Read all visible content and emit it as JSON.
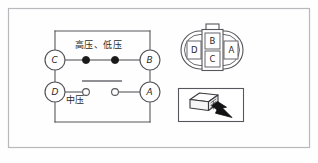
{
  "figure": {
    "name": "pressure-switch-connector-wiring-figure",
    "outer_frame": {
      "stroke": "#b9b9bd",
      "fill": "#fefefe"
    },
    "line_color": "#56565c",
    "text_color": "#2a2a2a"
  },
  "circuit": {
    "title_high_low": "高压、低压",
    "title_medium": "中压",
    "terminals": [
      {
        "id": "C",
        "label": "C",
        "cx": 55,
        "cy": 60,
        "r": 10
      },
      {
        "id": "B",
        "label": "B",
        "cx": 150,
        "cy": 60,
        "r": 10
      },
      {
        "id": "D",
        "label": "D",
        "cx": 55,
        "cy": 92,
        "r": 10
      },
      {
        "id": "A",
        "label": "A",
        "cx": 150,
        "cy": 92,
        "r": 10
      }
    ],
    "closed_contacts": [
      {
        "name": "contact-left-closed",
        "cx": 86,
        "cy": 60,
        "r": 3.6
      },
      {
        "name": "contact-right-closed",
        "cx": 115,
        "cy": 60,
        "r": 3.6
      }
    ],
    "open_contacts": [
      {
        "name": "contact-left-open",
        "cx": 86,
        "cy": 92,
        "r": 3.4
      },
      {
        "name": "contact-right-open",
        "cx": 115,
        "cy": 92,
        "r": 3.4
      }
    ],
    "switch_bar": {
      "x1": 82,
      "x2": 122,
      "y": 81
    }
  },
  "connector_face": {
    "name": "connector-face-diagram",
    "pins": [
      {
        "label": "D",
        "position": "left"
      },
      {
        "label": "B",
        "position": "center-top"
      },
      {
        "label": "C",
        "position": "center-bottom"
      },
      {
        "label": "A",
        "position": "right"
      }
    ]
  },
  "connector_photo": {
    "name": "connector-plug-illustration",
    "caption": ""
  }
}
